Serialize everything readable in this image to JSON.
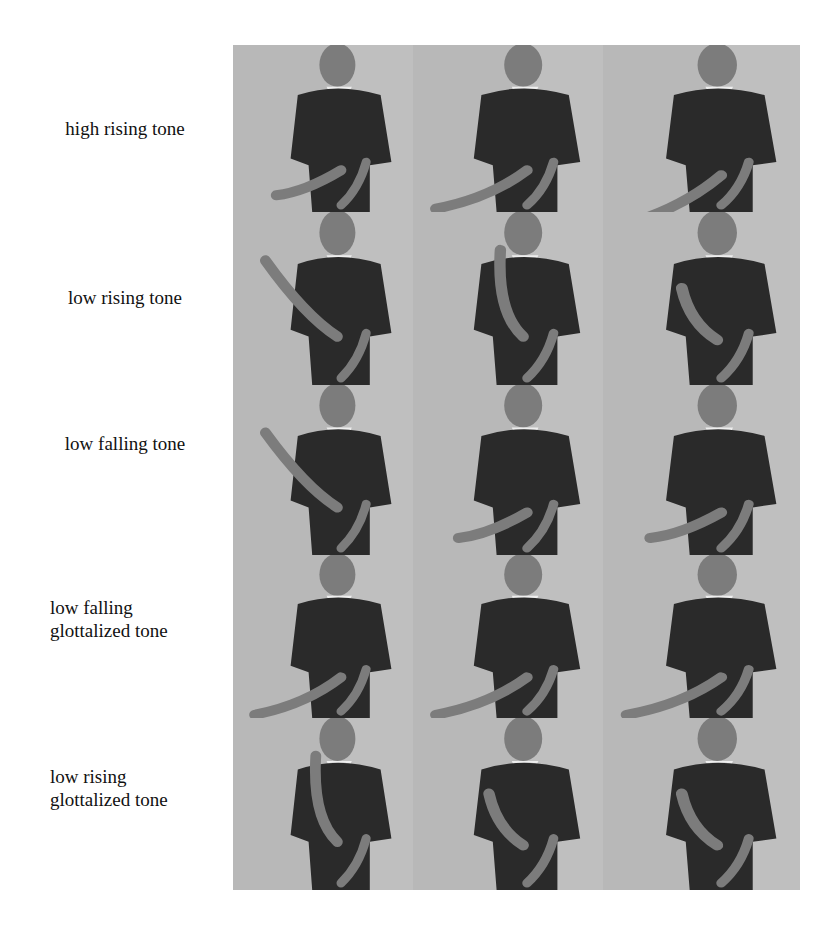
{
  "figure": {
    "rows": [
      {
        "label_lines": [
          "high rising tone"
        ],
        "frames": [
          {
            "hand": "low-left"
          },
          {
            "hand": "point-left"
          },
          {
            "hand": "point-left-low"
          }
        ]
      },
      {
        "label_lines": [
          "low rising tone"
        ],
        "frames": [
          {
            "hand": "up-left-far"
          },
          {
            "hand": "up-index"
          },
          {
            "hand": "fist-up"
          }
        ]
      },
      {
        "label_lines": [
          "low falling tone"
        ],
        "frames": [
          {
            "hand": "up-left-far"
          },
          {
            "hand": "low-left"
          },
          {
            "hand": "low-left"
          }
        ]
      },
      {
        "label_lines": [
          "low falling",
          "glottalized tone"
        ],
        "frames": [
          {
            "hand": "point-left"
          },
          {
            "hand": "point-left"
          },
          {
            "hand": "point-left"
          }
        ]
      },
      {
        "label_lines": [
          "low rising",
          "glottalized tone"
        ],
        "frames": [
          {
            "hand": "up-index"
          },
          {
            "hand": "fist-up"
          },
          {
            "hand": "fist-up"
          }
        ]
      }
    ],
    "colors": {
      "background": "#ffffff",
      "wall": "#b8b8b8",
      "shirt": "#2a2a2a",
      "skin": "#7c7c7c",
      "text": "#111111"
    }
  }
}
